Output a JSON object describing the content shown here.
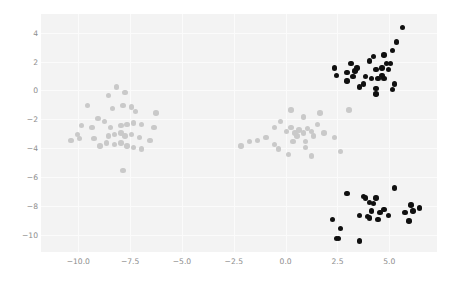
{
  "chart_data": {
    "type": "scatter",
    "title": "",
    "xlabel": "",
    "ylabel": "",
    "xlim": [
      -11.8,
      7.3
    ],
    "ylim": [
      -11.2,
      5.3
    ],
    "grid": true,
    "legend": null,
    "xticks": [
      "-10.0",
      "-7.5",
      "-5.0",
      "-2.5",
      "0.0",
      "2.5",
      "5.0"
    ],
    "xtick_values": [
      -10.0,
      -7.5,
      -5.0,
      -2.5,
      0.0,
      2.5,
      5.0
    ],
    "yticks": [
      "4",
      "2",
      "0",
      "-2",
      "-4",
      "-6",
      "-8",
      "-10"
    ],
    "ytick_values": [
      4,
      2,
      0,
      -2,
      -4,
      -6,
      -8,
      -10
    ],
    "colors": {
      "cluster_light": "#c9c9c9",
      "cluster_dark": "#101010",
      "plot_background": "#f3f3f3",
      "grid": "#fbfbfb",
      "tick_text": "#8d8d8d",
      "figure_background": "#ffffff"
    },
    "marker": {
      "shape": "circle",
      "size_px": 5.4
    },
    "series": [
      {
        "name": "cluster-light",
        "color": "#c9c9c9",
        "points": [
          [
            -9.55,
            -1.05
          ],
          [
            -8.55,
            -0.35
          ],
          [
            -8.15,
            0.25
          ],
          [
            -7.75,
            -0.15
          ],
          [
            -8.35,
            -1.25
          ],
          [
            -7.85,
            -1.05
          ],
          [
            -7.45,
            -1.15
          ],
          [
            -7.25,
            -1.45
          ],
          [
            -6.25,
            -1.55
          ],
          [
            -9.85,
            -2.45
          ],
          [
            -9.35,
            -2.55
          ],
          [
            -8.75,
            -2.15
          ],
          [
            -10.05,
            -3.05
          ],
          [
            -8.45,
            -2.55
          ],
          [
            -7.95,
            -2.45
          ],
          [
            -7.65,
            -2.35
          ],
          [
            -7.35,
            -2.25
          ],
          [
            -6.95,
            -2.35
          ],
          [
            -6.35,
            -2.55
          ],
          [
            -9.95,
            -3.35
          ],
          [
            -9.25,
            -3.35
          ],
          [
            -8.55,
            -3.15
          ],
          [
            -8.25,
            -3.05
          ],
          [
            -7.95,
            -2.95
          ],
          [
            -7.75,
            -3.15
          ],
          [
            -7.45,
            -3.05
          ],
          [
            -7.05,
            -3.25
          ],
          [
            -6.55,
            -3.45
          ],
          [
            -8.65,
            -3.65
          ],
          [
            -8.25,
            -3.75
          ],
          [
            -7.95,
            -3.65
          ],
          [
            -7.65,
            -3.85
          ],
          [
            -7.35,
            -3.95
          ],
          [
            -6.95,
            -4.05
          ],
          [
            -7.85,
            -5.55
          ],
          [
            -10.35,
            -3.45
          ],
          [
            -9.05,
            -1.95
          ],
          [
            -8.95,
            -3.85
          ],
          [
            -2.15,
            -3.85
          ],
          [
            -1.75,
            -3.55
          ],
          [
            -1.35,
            -3.45
          ],
          [
            -0.95,
            -3.25
          ],
          [
            -0.55,
            -2.55
          ],
          [
            -0.25,
            -2.15
          ],
          [
            0.05,
            -2.85
          ],
          [
            0.25,
            -2.55
          ],
          [
            0.45,
            -2.95
          ],
          [
            0.65,
            -2.75
          ],
          [
            0.55,
            -3.15
          ],
          [
            0.85,
            -2.95
          ],
          [
            1.05,
            -2.65
          ],
          [
            1.25,
            -2.85
          ],
          [
            1.55,
            -2.35
          ],
          [
            1.85,
            -2.95
          ],
          [
            0.35,
            -3.55
          ],
          [
            0.95,
            -3.55
          ],
          [
            0.95,
            -3.95
          ],
          [
            1.35,
            -3.15
          ],
          [
            -0.55,
            -3.75
          ],
          [
            0.25,
            -1.35
          ],
          [
            2.35,
            -3.25
          ],
          [
            2.65,
            -4.25
          ],
          [
            1.25,
            -4.55
          ],
          [
            0.15,
            -4.45
          ],
          [
            -0.35,
            -4.05
          ],
          [
            3.05,
            -1.35
          ],
          [
            1.65,
            -1.55
          ],
          [
            0.85,
            -1.85
          ]
        ]
      },
      {
        "name": "cluster-dark",
        "color": "#101010",
        "points": [
          [
            2.35,
            1.55
          ],
          [
            2.95,
            1.25
          ],
          [
            3.15,
            1.85
          ],
          [
            3.35,
            1.35
          ],
          [
            3.45,
            1.55
          ],
          [
            2.95,
            0.65
          ],
          [
            3.75,
            0.45
          ],
          [
            4.05,
            2.05
          ],
          [
            4.25,
            2.35
          ],
          [
            4.35,
            1.45
          ],
          [
            4.65,
            1.55
          ],
          [
            4.75,
            2.45
          ],
          [
            4.85,
            1.85
          ],
          [
            4.95,
            1.45
          ],
          [
            5.05,
            1.85
          ],
          [
            5.35,
            3.35
          ],
          [
            5.15,
            2.75
          ],
          [
            4.45,
            0.85
          ],
          [
            4.75,
            0.85
          ],
          [
            5.25,
            0.45
          ],
          [
            3.85,
            0.95
          ],
          [
            4.15,
            0.85
          ],
          [
            3.55,
            0.25
          ],
          [
            4.35,
            0.15
          ],
          [
            4.35,
            -0.25
          ],
          [
            5.15,
            0.05
          ],
          [
            5.65,
            4.35
          ],
          [
            2.45,
            1.05
          ],
          [
            3.25,
            0.95
          ],
          [
            4.65,
            1.05
          ],
          [
            2.95,
            -7.15
          ],
          [
            3.75,
            -7.35
          ],
          [
            3.85,
            -7.45
          ],
          [
            4.35,
            -7.45
          ],
          [
            4.05,
            -7.75
          ],
          [
            5.25,
            -6.75
          ],
          [
            4.15,
            -8.35
          ],
          [
            4.75,
            -8.25
          ],
          [
            4.55,
            -8.45
          ],
          [
            3.95,
            -8.75
          ],
          [
            4.05,
            -8.85
          ],
          [
            4.45,
            -8.95
          ],
          [
            4.95,
            -8.65
          ],
          [
            6.05,
            -7.95
          ],
          [
            5.75,
            -8.45
          ],
          [
            6.15,
            -8.35
          ],
          [
            6.45,
            -8.15
          ],
          [
            5.95,
            -9.05
          ],
          [
            2.25,
            -8.95
          ],
          [
            2.65,
            -9.55
          ],
          [
            2.45,
            -10.25
          ],
          [
            2.55,
            -10.25
          ],
          [
            3.55,
            -10.45
          ],
          [
            4.25,
            -7.85
          ],
          [
            3.55,
            -8.65
          ]
        ]
      }
    ]
  }
}
